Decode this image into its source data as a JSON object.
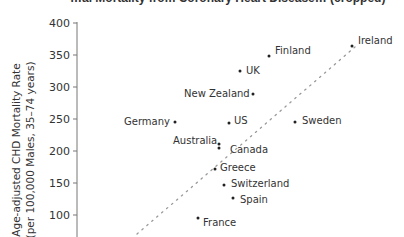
{
  "chart_data": {
    "type": "scatter",
    "title": "…al Mortality from Coronary Heart Disease… (cropped)",
    "xlabel": "",
    "ylabel": "Age-adjusted CHD Mortality Rate",
    "ylabel_sub": "(per 100,000 Males, 35–74 years)",
    "ylim": [
      75,
      400
    ],
    "yticks": [
      400,
      350,
      300,
      250,
      200,
      150,
      100
    ],
    "grid": false,
    "legend": null,
    "trendline": {
      "style": "dotted",
      "x1": 137,
      "y1": 234,
      "x2": 355,
      "y2": 47
    },
    "points": [
      {
        "label": "Ireland",
        "x": 352,
        "y": 364,
        "px": 352,
        "py": 46,
        "lx": 358,
        "ly": 44
      },
      {
        "label": "Finland",
        "x": 269,
        "y": 348,
        "px": 269,
        "py": 56,
        "lx": 275,
        "ly": 54
      },
      {
        "label": "UK",
        "x": 240,
        "y": 325,
        "px": 240,
        "py": 71,
        "lx": 246,
        "ly": 74
      },
      {
        "label": "New Zealand",
        "x": 253,
        "y": 289,
        "px": 253,
        "py": 94,
        "lx": 184,
        "ly": 97
      },
      {
        "label": "Germany",
        "x": 175,
        "y": 245,
        "px": 175,
        "py": 122,
        "lx": 124,
        "ly": 125
      },
      {
        "label": "US",
        "x": 229,
        "y": 244,
        "px": 229,
        "py": 123,
        "lx": 234,
        "ly": 124
      },
      {
        "label": "Sweden",
        "x": 295,
        "y": 245,
        "px": 295,
        "py": 122,
        "lx": 302,
        "ly": 124
      },
      {
        "label": "Australia",
        "x": 219,
        "y": 210,
        "px": 219,
        "py": 144,
        "lx": 173,
        "ly": 144
      },
      {
        "label": "Canada",
        "x": 219,
        "y": 204,
        "px": 219,
        "py": 148,
        "lx": 230,
        "ly": 153
      },
      {
        "label": "Greece",
        "x": 215,
        "y": 172,
        "px": 215,
        "py": 169,
        "lx": 220,
        "ly": 171
      },
      {
        "label": "Switzerland",
        "x": 224,
        "y": 147,
        "px": 224,
        "py": 185,
        "lx": 231,
        "ly": 187
      },
      {
        "label": "Spain",
        "x": 233,
        "y": 127,
        "px": 233,
        "py": 198,
        "lx": 240,
        "ly": 203
      },
      {
        "label": "France",
        "x": 198,
        "y": 95,
        "px": 198,
        "py": 218,
        "lx": 203,
        "ly": 226
      }
    ]
  }
}
